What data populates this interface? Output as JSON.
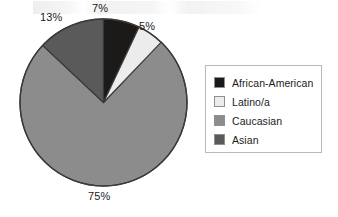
{
  "chart_data": {
    "type": "pie",
    "title": "",
    "categories": [
      "African-American",
      "Latino/a",
      "Caucasian",
      "Asian"
    ],
    "values": [
      7,
      5,
      75,
      13
    ],
    "value_unit": "%",
    "data_labels": [
      "7%",
      "5%",
      "75%",
      "13%"
    ],
    "colors": [
      "#1c1a18",
      "#ececec",
      "#8c8c8c",
      "#5a5a5a"
    ],
    "start_angle_deg": 0,
    "direction": "clockwise",
    "legend": {
      "position": "right",
      "bordered": true,
      "entries": [
        {
          "label": "African-American",
          "color": "#1c1a18"
        },
        {
          "label": "Latino/a",
          "color": "#ececec"
        },
        {
          "label": "Caucasian",
          "color": "#8c8c8c"
        },
        {
          "label": "Asian",
          "color": "#5a5a5a"
        }
      ]
    },
    "grid": false,
    "xlabel": "",
    "ylabel": ""
  },
  "pie": {
    "outline_color": "#3a3a3a",
    "labels": {
      "african_american": "7%",
      "latino": "5%",
      "caucasian": "75%",
      "asian": "13%"
    }
  }
}
